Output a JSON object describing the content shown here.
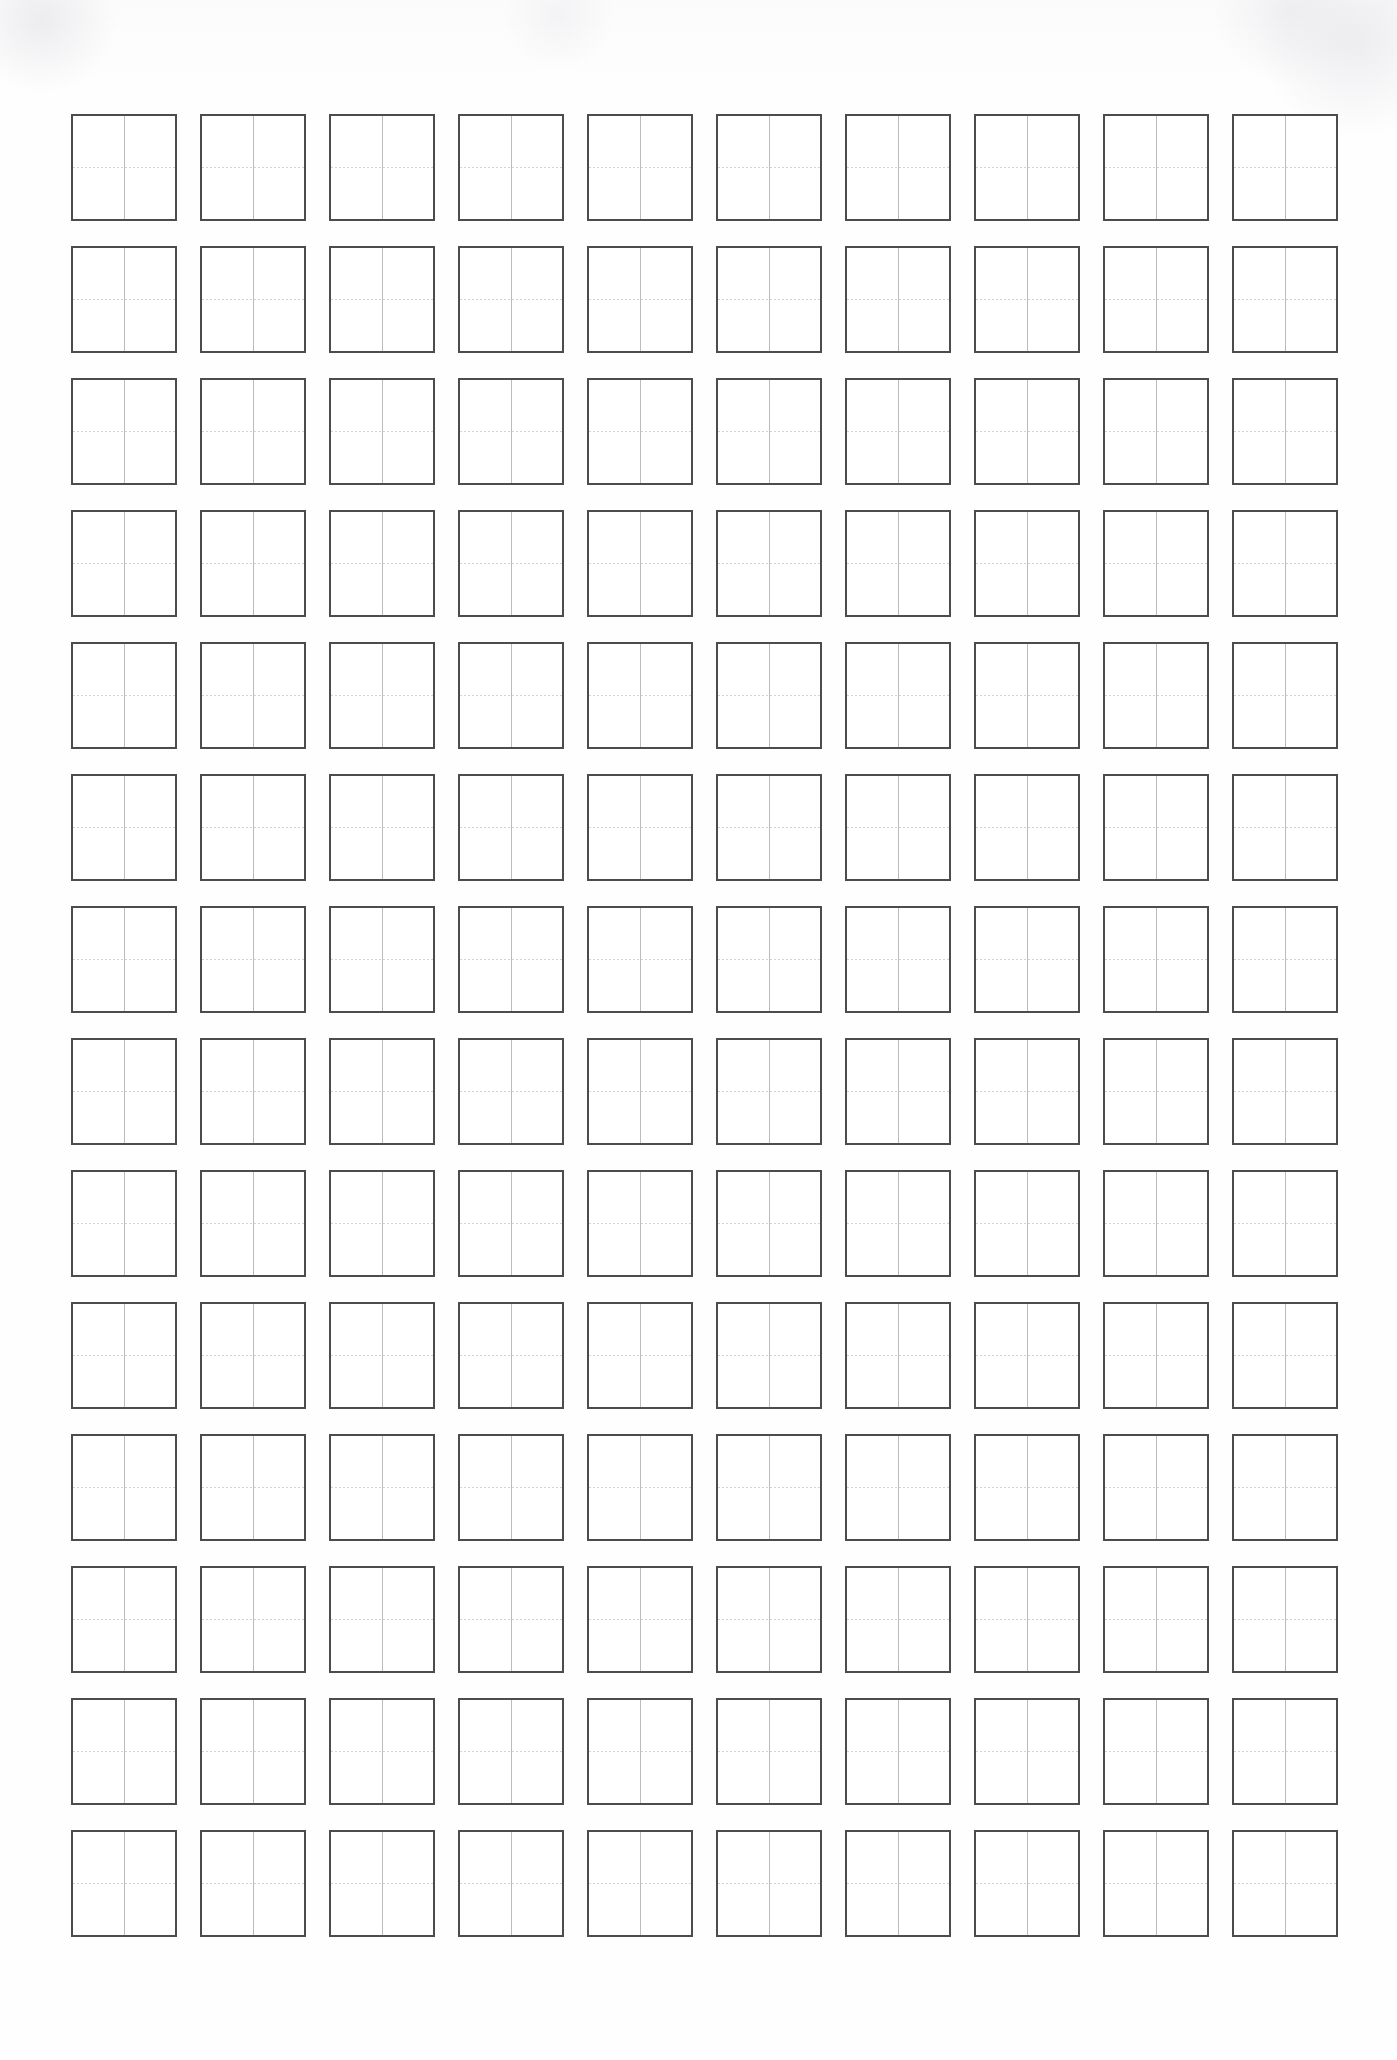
{
  "document": {
    "kind": "writing-practice-grid-worksheet",
    "title": "Blank Practice Grid",
    "page_background": "#ffffff",
    "paper_tone": "#fefefe"
  },
  "grid": {
    "columns": 10,
    "rows": 14,
    "total_cells": 140,
    "cell": {
      "width_px": 106,
      "height_px": 107,
      "border_color": "#4c4c4c",
      "border_width_px": 2,
      "fill": "#ffffff"
    },
    "spacing": {
      "column_gap_px": 23,
      "row_gap_px": 25,
      "origin_x_px": 71,
      "origin_y_px": 114
    },
    "guides": {
      "vertical": {
        "name": "vertical-center-guide",
        "style": "solid",
        "color": "#bcbcbc"
      },
      "horizontal": {
        "name": "horizontal-center-guide",
        "style": "dotted",
        "color": "#d2d2d2"
      }
    },
    "cell_contents": [
      [
        "",
        "",
        "",
        "",
        "",
        "",
        "",
        "",
        "",
        ""
      ],
      [
        "",
        "",
        "",
        "",
        "",
        "",
        "",
        "",
        "",
        ""
      ],
      [
        "",
        "",
        "",
        "",
        "",
        "",
        "",
        "",
        "",
        ""
      ],
      [
        "",
        "",
        "",
        "",
        "",
        "",
        "",
        "",
        "",
        ""
      ],
      [
        "",
        "",
        "",
        "",
        "",
        "",
        "",
        "",
        "",
        ""
      ],
      [
        "",
        "",
        "",
        "",
        "",
        "",
        "",
        "",
        "",
        ""
      ],
      [
        "",
        "",
        "",
        "",
        "",
        "",
        "",
        "",
        "",
        ""
      ],
      [
        "",
        "",
        "",
        "",
        "",
        "",
        "",
        "",
        "",
        ""
      ],
      [
        "",
        "",
        "",
        "",
        "",
        "",
        "",
        "",
        "",
        ""
      ],
      [
        "",
        "",
        "",
        "",
        "",
        "",
        "",
        "",
        "",
        ""
      ],
      [
        "",
        "",
        "",
        "",
        "",
        "",
        "",
        "",
        "",
        ""
      ],
      [
        "",
        "",
        "",
        "",
        "",
        "",
        "",
        "",
        "",
        ""
      ],
      [
        "",
        "",
        "",
        "",
        "",
        "",
        "",
        "",
        "",
        ""
      ],
      [
        "",
        "",
        "",
        "",
        "",
        "",
        "",
        "",
        "",
        ""
      ]
    ]
  }
}
